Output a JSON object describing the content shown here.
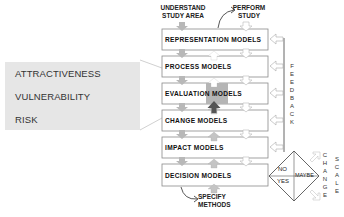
{
  "diagram": {
    "type": "flowchart",
    "top_labels": {
      "understand": [
        "UNDERSTAND",
        "STUDY AREA"
      ],
      "perform": [
        "PERFORM",
        "STUDY"
      ]
    },
    "boxes": [
      {
        "label": "REPRESENTATION MODELS"
      },
      {
        "label": "PROCESS MODELS"
      },
      {
        "label": "EVALUATION MODELS",
        "highlighted": true
      },
      {
        "label": "CHANGE MODELS"
      },
      {
        "label": "IMPACT MODELS"
      },
      {
        "label": "DECISION MODELS"
      }
    ],
    "bottom_label": [
      "SPECIFY",
      "METHODS"
    ],
    "feedback_label": [
      "F",
      "E",
      "E",
      "D",
      "B",
      "A",
      "C",
      "K"
    ],
    "decision": {
      "no": "NO",
      "yes": "YES",
      "maybe": "MAYBE"
    },
    "change_label": [
      "C",
      "H",
      "A",
      "N",
      "G",
      "E"
    ],
    "scale_label": [
      "S",
      "C",
      "A",
      "L",
      "E"
    ],
    "evaluation_panel": {
      "items": [
        "ATTRACTIVENESS",
        "VULNERABILITY",
        "RISK"
      ]
    },
    "colors": {
      "box_border": "#8a8a8a",
      "arrow_gray": "#b8b8b8",
      "arrow_dark": "#555555",
      "panel_bg": "#e6e6e6",
      "highlight": "#b5b5b5"
    }
  }
}
